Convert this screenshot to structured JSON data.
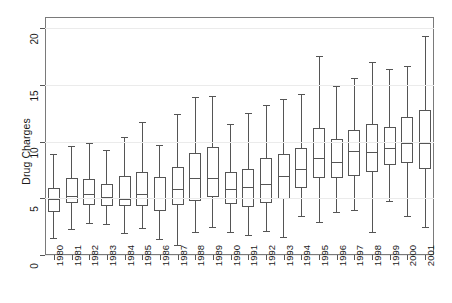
{
  "chart_data": {
    "type": "box",
    "title": "",
    "xlabel": "",
    "ylabel": "Drug Charges",
    "ylim": [
      0,
      21
    ],
    "yticks": [
      0,
      5,
      10,
      15,
      20
    ],
    "ytick_labels": [
      "0",
      "5",
      "10",
      "15",
      "20"
    ],
    "grid": true,
    "legend": "none",
    "categories": [
      "1980",
      "1981",
      "1982",
      "1983",
      "1984",
      "1985",
      "1986",
      "1987",
      "1988",
      "1989",
      "1990",
      "1991",
      "1992",
      "1993",
      "1994",
      "1995",
      "1996",
      "1997",
      "1998",
      "1999",
      "2000",
      "2001"
    ],
    "box_stats": [
      {
        "category": "1980",
        "whisker_low": 1.5,
        "q1": 3.8,
        "median": 4.9,
        "q3": 5.9,
        "whisker_high": 8.9
      },
      {
        "category": "1981",
        "whisker_low": 2.3,
        "q1": 4.6,
        "median": 5.2,
        "q3": 6.8,
        "whisker_high": 9.6
      },
      {
        "category": "1982",
        "whisker_low": 2.8,
        "q1": 4.4,
        "median": 5.4,
        "q3": 6.7,
        "whisker_high": 9.9
      },
      {
        "category": "1983",
        "whisker_low": 2.7,
        "q1": 4.3,
        "median": 5.1,
        "q3": 6.3,
        "whisker_high": 9.3
      },
      {
        "category": "1984",
        "whisker_low": 1.9,
        "q1": 4.3,
        "median": 4.9,
        "q3": 7.0,
        "whisker_high": 10.4
      },
      {
        "category": "1985",
        "whisker_low": 2.4,
        "q1": 4.3,
        "median": 5.4,
        "q3": 7.3,
        "whisker_high": 11.7
      },
      {
        "category": "1986",
        "whisker_low": 1.4,
        "q1": 3.9,
        "median": 5.0,
        "q3": 6.9,
        "whisker_high": 9.7
      },
      {
        "category": "1987",
        "whisker_low": 0.9,
        "q1": 4.4,
        "median": 5.8,
        "q3": 7.8,
        "whisker_high": 12.4
      },
      {
        "category": "1988",
        "whisker_low": 2.0,
        "q1": 4.8,
        "median": 6.8,
        "q3": 9.0,
        "whisker_high": 13.9
      },
      {
        "category": "1989",
        "whisker_low": 2.5,
        "q1": 5.1,
        "median": 6.8,
        "q3": 9.5,
        "whisker_high": 14.0
      },
      {
        "category": "1990",
        "whisker_low": 2.0,
        "q1": 4.5,
        "median": 5.8,
        "q3": 7.3,
        "whisker_high": 11.6
      },
      {
        "category": "1991",
        "whisker_low": 1.8,
        "q1": 4.2,
        "median": 6.0,
        "q3": 7.6,
        "whisker_high": 12.5
      },
      {
        "category": "1992",
        "whisker_low": 2.1,
        "q1": 4.6,
        "median": 6.3,
        "q3": 8.6,
        "whisker_high": 13.2
      },
      {
        "category": "1993",
        "whisker_low": 1.6,
        "q1": 4.9,
        "median": 7.0,
        "q3": 8.9,
        "whisker_high": 13.8
      },
      {
        "category": "1994",
        "whisker_low": 3.4,
        "q1": 5.9,
        "median": 7.6,
        "q3": 9.4,
        "whisker_high": 14.2
      },
      {
        "category": "1995",
        "whisker_low": 2.9,
        "q1": 6.8,
        "median": 8.6,
        "q3": 11.2,
        "whisker_high": 17.6
      },
      {
        "category": "1996",
        "whisker_low": 3.8,
        "q1": 6.8,
        "median": 8.2,
        "q3": 10.2,
        "whisker_high": 14.9
      },
      {
        "category": "1997",
        "whisker_low": 4.0,
        "q1": 7.0,
        "median": 9.2,
        "q3": 11.0,
        "whisker_high": 15.6
      },
      {
        "category": "1998",
        "whisker_low": 2.0,
        "q1": 7.3,
        "median": 9.1,
        "q3": 11.6,
        "whisker_high": 17.0
      },
      {
        "category": "1999",
        "whisker_low": 4.8,
        "q1": 7.9,
        "median": 9.4,
        "q3": 11.3,
        "whisker_high": 16.4
      },
      {
        "category": "2000",
        "whisker_low": 3.4,
        "q1": 8.1,
        "median": 9.9,
        "q3": 12.2,
        "whisker_high": 16.7
      },
      {
        "category": "2001",
        "whisker_low": 2.5,
        "q1": 7.6,
        "median": 9.9,
        "q3": 12.8,
        "whisker_high": 19.3
      }
    ],
    "colors": {
      "line": "#555555",
      "frame": "#7a7a7a",
      "grid": "#ebebeb",
      "background": "#ffffff",
      "text": "#1a1a1a"
    }
  }
}
